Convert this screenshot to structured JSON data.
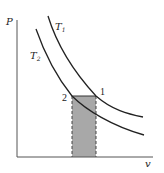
{
  "diagram": {
    "type": "P-v diagram",
    "axes": {
      "y_label": "P",
      "x_label": "v"
    },
    "curves": [
      {
        "name": "T1",
        "label_main": "T",
        "label_sub": "1"
      },
      {
        "name": "T2",
        "label_main": "T",
        "label_sub": "2"
      }
    ],
    "points": [
      {
        "label": "1"
      },
      {
        "label": "2"
      }
    ],
    "shaded_area": {
      "fill": "#a8a8a8",
      "border": "dashed"
    },
    "colors": {
      "line": "#222222",
      "shade": "#a8a8a8",
      "background": "#ffffff"
    }
  }
}
